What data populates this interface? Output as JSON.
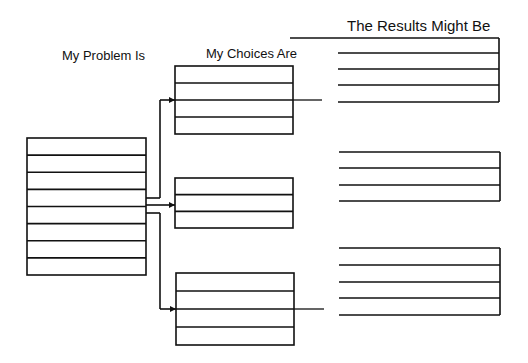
{
  "labels": {
    "problem": "My Problem Is",
    "choices": "My Choices Are",
    "results": "The Results Might Be"
  },
  "colors": {
    "stroke": "#111111",
    "background": "#ffffff"
  },
  "problem_box": {
    "x": 27,
    "y": 138,
    "w": 119,
    "h": 137,
    "rows": 8
  },
  "choice_boxes": [
    {
      "x": 175,
      "y": 66,
      "w": 118,
      "h": 68,
      "rows": 4,
      "arrow_y": 100,
      "connector_to_x": 322
    },
    {
      "x": 175,
      "y": 178,
      "w": 118,
      "h": 50,
      "rows": 3,
      "arrow_y": 205,
      "connector_to_x": null
    },
    {
      "x": 176,
      "y": 273,
      "w": 118,
      "h": 72,
      "rows": 4,
      "arrow_y": 309,
      "connector_to_x": 324
    }
  ],
  "result_groups": [
    {
      "top_line_from_x": 290,
      "x1": 338,
      "x2": 499,
      "lines_y": [
        38,
        53,
        69,
        85,
        102
      ]
    },
    {
      "top_line_from_x": null,
      "x1": 339,
      "x2": 500,
      "lines_y": [
        152,
        168,
        185,
        201
      ]
    },
    {
      "top_line_from_x": null,
      "x1": 339,
      "x2": 500,
      "lines_y": [
        248,
        265,
        282,
        298,
        315
      ]
    }
  ],
  "branch": {
    "trunk_x": 160,
    "from_y_top": 198,
    "from_y_mid": 205,
    "from_y_bot": 213
  }
}
